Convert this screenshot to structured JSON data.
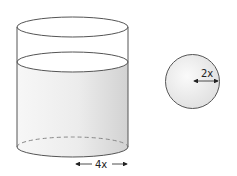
{
  "diagram": {
    "cylinder": {
      "radius_label": "4x",
      "has_liquid": true
    },
    "sphere": {
      "radius_label": "2x"
    },
    "colors": {
      "outline": "#555555",
      "liquid_light": "#ffffff",
      "liquid_dark": "#d4d4d4"
    }
  }
}
